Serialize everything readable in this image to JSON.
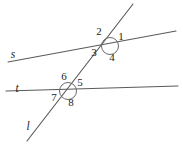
{
  "figure": {
    "background_color": "#ffffff",
    "line_color": "#5a5a5a",
    "circle_color": "#6a6a6a",
    "text_color": "#1c1c1c"
  },
  "lines": {
    "s": {
      "name": "s",
      "label": "s",
      "label_x": 13,
      "label_y": 58,
      "x1": 8,
      "y1": 62,
      "x2": 176,
      "y2": 31
    },
    "t": {
      "name": "t",
      "label": "t",
      "label_x": 17,
      "label_y": 92,
      "x1": 6,
      "y1": 91,
      "x2": 178,
      "y2": 86
    },
    "l": {
      "name": "l",
      "label": "l",
      "label_x": 28,
      "label_y": 130,
      "x1": 133,
      "y1": 4,
      "x2": 27,
      "y2": 141
    }
  },
  "intersections": [
    {
      "name": "upper-intersection",
      "lines": "l and s",
      "cx": 110,
      "cy": 46,
      "r": 8.5
    },
    {
      "name": "lower-intersection",
      "lines": "l and t",
      "cx": 68,
      "cy": 91,
      "r": 8.5
    }
  ],
  "angles": [
    {
      "id": "1",
      "label": "1",
      "x": 121,
      "y": 40,
      "intersection": "upper-intersection"
    },
    {
      "id": "2",
      "label": "2",
      "x": 99,
      "y": 35,
      "intersection": "upper-intersection"
    },
    {
      "id": "3",
      "label": "3",
      "x": 94,
      "y": 56,
      "intersection": "upper-intersection"
    },
    {
      "id": "4",
      "label": "4",
      "x": 112,
      "y": 61,
      "intersection": "upper-intersection"
    },
    {
      "id": "5",
      "label": "5",
      "x": 80,
      "y": 86,
      "intersection": "lower-intersection"
    },
    {
      "id": "6",
      "label": "6",
      "x": 64,
      "y": 80,
      "intersection": "lower-intersection"
    },
    {
      "id": "7",
      "label": "7",
      "x": 54,
      "y": 101,
      "intersection": "lower-intersection"
    },
    {
      "id": "8",
      "label": "8",
      "x": 71,
      "y": 106,
      "intersection": "lower-intersection"
    }
  ]
}
